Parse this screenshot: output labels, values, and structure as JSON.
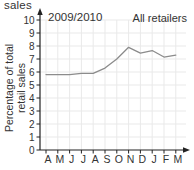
{
  "page": {
    "caption": "sales"
  },
  "chart_data": {
    "type": "line",
    "caption_fragment": "sales",
    "annotations": {
      "top_left": "2009/2010",
      "top_right": "All retailers"
    },
    "categories": [
      "A",
      "M",
      "J",
      "J",
      "A",
      "S",
      "O",
      "N",
      "D",
      "J",
      "F",
      "M"
    ],
    "series": [
      {
        "name": "All retailers",
        "values": [
          5.8,
          5.8,
          5.8,
          5.9,
          5.9,
          6.3,
          7.0,
          7.9,
          7.45,
          7.65,
          7.15,
          7.3
        ]
      }
    ],
    "xlabel": "",
    "ylabel": "Percentage of total retail sales",
    "ylabel_lines": [
      "Percentage of total",
      "retail sales"
    ],
    "ylim": [
      0,
      10
    ],
    "yticks": [
      0,
      1,
      2,
      3,
      4,
      5,
      6,
      7,
      8,
      9,
      10
    ],
    "grid": true,
    "legend_position": "none",
    "colors": {
      "line": "#8c8c8c",
      "grid": "#e9e9e9",
      "axis": "#222222",
      "text": "#333333"
    }
  }
}
